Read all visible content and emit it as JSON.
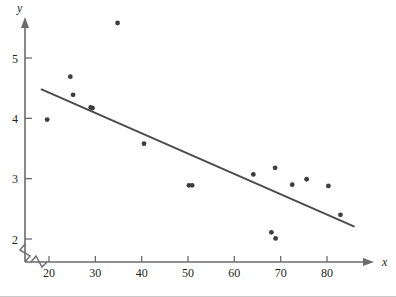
{
  "figure": {
    "background": "#ffffff",
    "ink_color": "#3a3a3a",
    "axis_color": "#6b6b6b",
    "point_color": "#3d3d3d",
    "line_color": "#4a4a4a"
  },
  "chart_data": {
    "type": "scatter",
    "title": "",
    "subtitle": "",
    "xlabel": "x",
    "ylabel": "y",
    "xlim": [
      15,
      86
    ],
    "ylim": [
      1.72,
      5.75
    ],
    "xticks": [
      20,
      30,
      40,
      50,
      60,
      70,
      80
    ],
    "xtick_labels": [
      "20",
      "30",
      "40",
      "50",
      "60",
      "70",
      "80"
    ],
    "yticks": [
      2,
      3,
      4,
      5
    ],
    "ytick_labels": [
      "2",
      "3",
      "4",
      "5"
    ],
    "grid": false,
    "legend": null,
    "axis_break_x": true,
    "axis_break_y": true,
    "x_axis_arrow": true,
    "y_axis_arrow": true,
    "points": [
      {
        "x": 19.6,
        "y": 3.98
      },
      {
        "x": 24.6,
        "y": 4.69
      },
      {
        "x": 25.2,
        "y": 4.39
      },
      {
        "x": 29.0,
        "y": 4.18
      },
      {
        "x": 29.4,
        "y": 4.17
      },
      {
        "x": 34.8,
        "y": 5.58
      },
      {
        "x": 40.5,
        "y": 3.58
      },
      {
        "x": 50.2,
        "y": 2.89
      },
      {
        "x": 50.9,
        "y": 2.89
      },
      {
        "x": 64.1,
        "y": 3.07
      },
      {
        "x": 68.0,
        "y": 2.11
      },
      {
        "x": 68.9,
        "y": 2.01
      },
      {
        "x": 68.8,
        "y": 3.18
      },
      {
        "x": 72.5,
        "y": 2.9
      },
      {
        "x": 75.6,
        "y": 2.99
      },
      {
        "x": 80.3,
        "y": 2.88
      },
      {
        "x": 82.9,
        "y": 2.4
      }
    ],
    "fit_line": {
      "type": "linear",
      "x_start": 18.4,
      "y_start": 4.48,
      "x_end": 85.8,
      "y_end": 2.21,
      "slope": -0.0337,
      "intercept": 5.1
    }
  },
  "annotations": {
    "x_axis_label": "x",
    "y_axis_label": "y"
  }
}
